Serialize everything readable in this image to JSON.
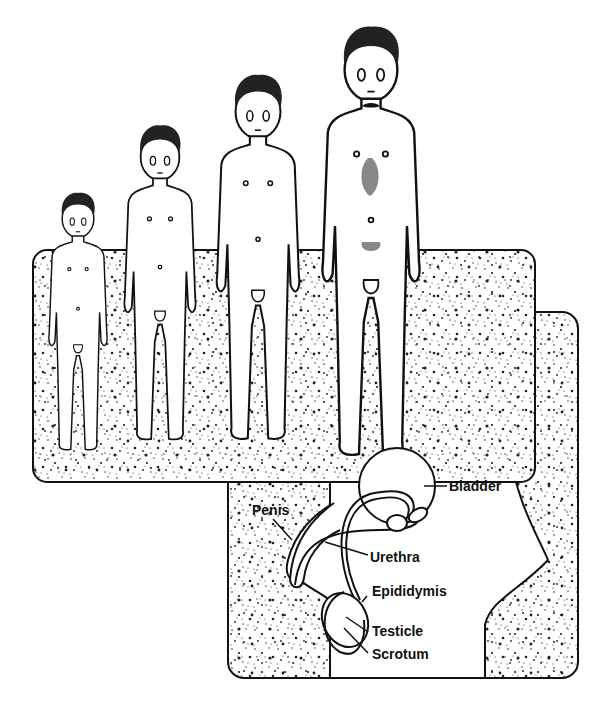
{
  "diagram": {
    "type": "anatomical-illustration",
    "colors": {
      "ink": "#111111",
      "background": "#ffffff",
      "stipple": "#222222"
    },
    "figures": [
      {
        "id": "child",
        "stage": 1
      },
      {
        "id": "early-puberty",
        "stage": 2
      },
      {
        "id": "mid-puberty",
        "stage": 3
      },
      {
        "id": "adult",
        "stage": 4
      }
    ],
    "labels": {
      "bladder": "Bladder",
      "penis": "Penis",
      "urethra": "Urethra",
      "epididymis": "Epididymis",
      "testicle": "Testicle",
      "scrotum": "Scrotum"
    }
  }
}
